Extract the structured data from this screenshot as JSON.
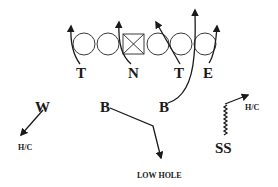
{
  "diagram": {
    "offense": {
      "linemen": [
        {
          "type": "circle",
          "role": "left-tackle"
        },
        {
          "type": "circle",
          "role": "left-guard"
        },
        {
          "type": "square",
          "role": "center"
        },
        {
          "type": "circle",
          "role": "right-guard"
        },
        {
          "type": "circle",
          "role": "right-tackle"
        },
        {
          "type": "circle",
          "role": "tight-end"
        }
      ]
    },
    "defense": {
      "line": [
        {
          "label": "T",
          "route": "loop-up-field"
        },
        {
          "label": "N",
          "route": "loop-up-field"
        },
        {
          "label": "T",
          "route": "slant-inside"
        },
        {
          "label": "E",
          "route": "rush-up-field"
        }
      ],
      "second_level": [
        {
          "label": "W",
          "route": "drop",
          "assignment": "H/C"
        },
        {
          "label": "B",
          "route": "drop",
          "assignment": "LOW HOLE"
        },
        {
          "label": "B",
          "route": "blitz"
        },
        {
          "label": "SS",
          "route": "creep-then-drop",
          "assignment": "H/C"
        }
      ]
    },
    "labels": {
      "t_left": "T",
      "n": "N",
      "t_right": "T",
      "e": "E",
      "w": "W",
      "b_left": "B",
      "b_right": "B",
      "ss": "SS",
      "hc_left": "H/C",
      "low_hole": "LOW HOLE",
      "hc_right": "H/C"
    }
  }
}
